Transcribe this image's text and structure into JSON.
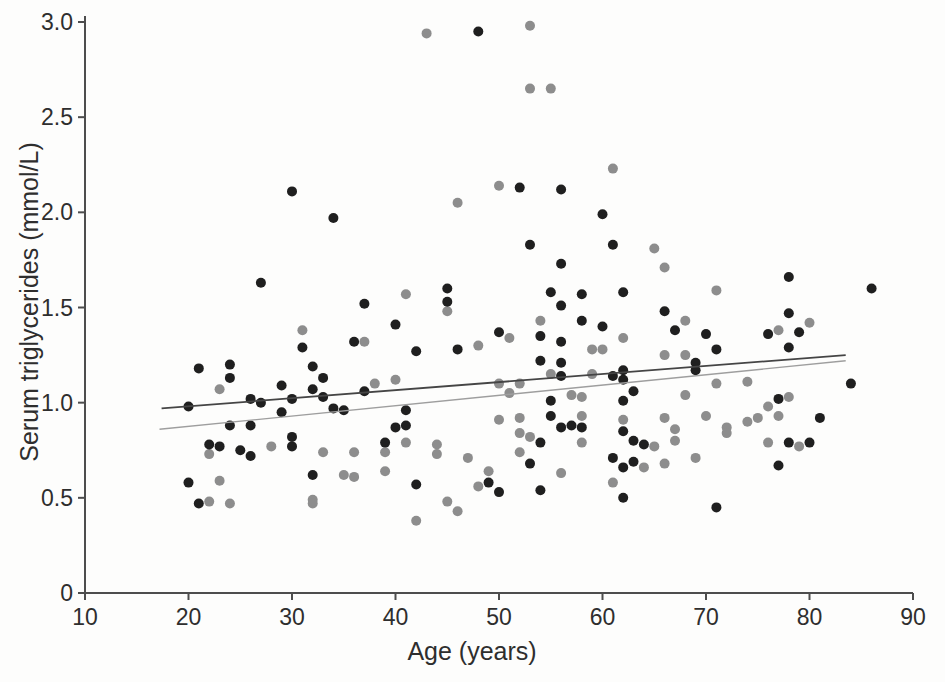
{
  "figure": {
    "background": "#fdfdfc"
  },
  "chart_data": {
    "type": "scatter",
    "title": "",
    "xlabel": "Age (years)",
    "ylabel": "Serum triglycerides (mmol/L)",
    "grid": false,
    "legend": null,
    "x_axis": {
      "min": 10,
      "max": 90,
      "ticks": [
        10,
        20,
        30,
        40,
        50,
        60,
        70,
        80,
        90
      ]
    },
    "y_axis": {
      "min": 0,
      "max": 3,
      "ticks": [
        0,
        0.5,
        1.0,
        1.5,
        2.0,
        2.5,
        3.0
      ],
      "tick_labels": [
        "0",
        "0.5",
        "1.0",
        "1.5",
        "2.0",
        "2.5",
        "3.0"
      ]
    },
    "series": [
      {
        "name": "dark-dots",
        "marker_color": "#1f1f1f",
        "points": [
          [
            30,
            2.11
          ],
          [
            27,
            1.63
          ],
          [
            48,
            2.95
          ],
          [
            34,
            1.97
          ],
          [
            45,
            1.6
          ],
          [
            45,
            1.53
          ],
          [
            37,
            1.52
          ],
          [
            52,
            2.13
          ],
          [
            56,
            2.12
          ],
          [
            60,
            1.99
          ],
          [
            53,
            1.83
          ],
          [
            61,
            1.83
          ],
          [
            56,
            1.73
          ],
          [
            55,
            1.58
          ],
          [
            58,
            1.57
          ],
          [
            62,
            1.58
          ],
          [
            78,
            1.66
          ],
          [
            86,
            1.6
          ],
          [
            21,
            1.18
          ],
          [
            24,
            1.2
          ],
          [
            24,
            1.13
          ],
          [
            29,
            1.09
          ],
          [
            26,
            1.02
          ],
          [
            27,
            1.0
          ],
          [
            20,
            0.98
          ],
          [
            29,
            0.95
          ],
          [
            24,
            0.88
          ],
          [
            26,
            0.88
          ],
          [
            22,
            0.78
          ],
          [
            23,
            0.77
          ],
          [
            25,
            0.75
          ],
          [
            26,
            0.72
          ],
          [
            20,
            0.58
          ],
          [
            21,
            0.47
          ],
          [
            30,
            1.02
          ],
          [
            30,
            0.82
          ],
          [
            30,
            0.77
          ],
          [
            40,
            1.41
          ],
          [
            36,
            1.32
          ],
          [
            31,
            1.29
          ],
          [
            42,
            1.27
          ],
          [
            46,
            1.28
          ],
          [
            50,
            1.37
          ],
          [
            32,
            1.19
          ],
          [
            33,
            1.13
          ],
          [
            37,
            1.06
          ],
          [
            32,
            1.07
          ],
          [
            33,
            1.03
          ],
          [
            34,
            0.97
          ],
          [
            35,
            0.96
          ],
          [
            41,
            0.96
          ],
          [
            41,
            0.88
          ],
          [
            40,
            0.87
          ],
          [
            39,
            0.79
          ],
          [
            32,
            0.62
          ],
          [
            42,
            0.57
          ],
          [
            49,
            0.58
          ],
          [
            50,
            0.53
          ],
          [
            53,
            0.68
          ],
          [
            54,
            0.54
          ],
          [
            56,
            1.51
          ],
          [
            66,
            1.48
          ],
          [
            58,
            1.43
          ],
          [
            60,
            1.4
          ],
          [
            54,
            1.35
          ],
          [
            56,
            1.32
          ],
          [
            67,
            1.38
          ],
          [
            70,
            1.36
          ],
          [
            69,
            1.21
          ],
          [
            69,
            1.17
          ],
          [
            54,
            1.22
          ],
          [
            56,
            1.21
          ],
          [
            56,
            1.14
          ],
          [
            61,
            1.14
          ],
          [
            62,
            1.17
          ],
          [
            62,
            1.12
          ],
          [
            63,
            1.06
          ],
          [
            55,
            1.01
          ],
          [
            62,
            1.01
          ],
          [
            55,
            0.93
          ],
          [
            56,
            0.87
          ],
          [
            57,
            0.88
          ],
          [
            58,
            0.87
          ],
          [
            54,
            0.79
          ],
          [
            62,
            0.85
          ],
          [
            63,
            0.8
          ],
          [
            64,
            0.78
          ],
          [
            61,
            0.71
          ],
          [
            62,
            0.66
          ],
          [
            63,
            0.69
          ],
          [
            62,
            0.5
          ],
          [
            71,
            0.45
          ],
          [
            78,
            1.47
          ],
          [
            76,
            1.36
          ],
          [
            79,
            1.37
          ],
          [
            78,
            1.29
          ],
          [
            71,
            1.28
          ],
          [
            84,
            1.1
          ],
          [
            77,
            1.02
          ],
          [
            81,
            0.92
          ],
          [
            78,
            0.79
          ],
          [
            80,
            0.79
          ],
          [
            77,
            0.67
          ]
        ]
      },
      {
        "name": "gray-dots",
        "marker_color": "#8d8d8d",
        "points": [
          [
            43,
            2.94
          ],
          [
            50,
            2.14
          ],
          [
            46,
            2.05
          ],
          [
            41,
            1.57
          ],
          [
            53,
            2.98
          ],
          [
            53,
            2.65
          ],
          [
            55,
            2.65
          ],
          [
            61,
            2.23
          ],
          [
            65,
            1.81
          ],
          [
            66,
            1.71
          ],
          [
            71,
            1.59
          ],
          [
            23,
            1.07
          ],
          [
            22,
            0.73
          ],
          [
            28,
            0.77
          ],
          [
            23,
            0.59
          ],
          [
            22,
            0.48
          ],
          [
            24,
            0.47
          ],
          [
            45,
            1.48
          ],
          [
            31,
            1.38
          ],
          [
            37,
            1.32
          ],
          [
            38,
            1.1
          ],
          [
            40,
            1.12
          ],
          [
            39,
            0.74
          ],
          [
            41,
            0.79
          ],
          [
            44,
            0.78
          ],
          [
            44,
            0.73
          ],
          [
            33,
            0.74
          ],
          [
            36,
            0.74
          ],
          [
            47,
            0.71
          ],
          [
            39,
            0.64
          ],
          [
            35,
            0.62
          ],
          [
            36,
            0.61
          ],
          [
            32,
            0.49
          ],
          [
            32,
            0.47
          ],
          [
            45,
            0.48
          ],
          [
            46,
            0.43
          ],
          [
            42,
            0.38
          ],
          [
            48,
            1.3
          ],
          [
            50,
            0.91
          ],
          [
            48,
            0.56
          ],
          [
            49,
            0.64
          ],
          [
            54,
            1.43
          ],
          [
            68,
            1.43
          ],
          [
            62,
            1.34
          ],
          [
            51,
            1.34
          ],
          [
            59,
            1.28
          ],
          [
            60,
            1.28
          ],
          [
            66,
            1.25
          ],
          [
            68,
            1.25
          ],
          [
            55,
            1.15
          ],
          [
            59,
            1.15
          ],
          [
            50,
            1.1
          ],
          [
            52,
            1.1
          ],
          [
            51,
            1.05
          ],
          [
            57,
            1.04
          ],
          [
            58,
            1.03
          ],
          [
            68,
            1.04
          ],
          [
            52,
            0.92
          ],
          [
            58,
            0.93
          ],
          [
            52,
            0.84
          ],
          [
            53,
            0.82
          ],
          [
            52,
            0.74
          ],
          [
            62,
            0.91
          ],
          [
            65,
            0.77
          ],
          [
            67,
            0.86
          ],
          [
            67,
            0.8
          ],
          [
            72,
            0.87
          ],
          [
            72,
            0.84
          ],
          [
            56,
            0.63
          ],
          [
            61,
            0.58
          ],
          [
            58,
            0.79
          ],
          [
            64,
            0.66
          ],
          [
            66,
            0.68
          ],
          [
            69,
            0.71
          ],
          [
            66,
            0.92
          ],
          [
            70,
            0.93
          ],
          [
            71,
            1.1
          ],
          [
            80,
            1.42
          ],
          [
            77,
            1.38
          ],
          [
            74,
            1.11
          ],
          [
            78,
            1.03
          ],
          [
            76,
            0.98
          ],
          [
            74,
            0.9
          ],
          [
            75,
            0.92
          ],
          [
            77,
            0.93
          ],
          [
            76,
            0.79
          ],
          [
            79,
            0.77
          ]
        ]
      }
    ],
    "trend_lines": [
      {
        "name": "dark-trend",
        "color": "#454545",
        "start": [
          17.4,
          0.97
        ],
        "end": [
          83.5,
          1.25
        ]
      },
      {
        "name": "light-trend",
        "color": "#9e9e9e",
        "start": [
          17.2,
          0.86
        ],
        "end": [
          83.5,
          1.22
        ]
      }
    ]
  }
}
